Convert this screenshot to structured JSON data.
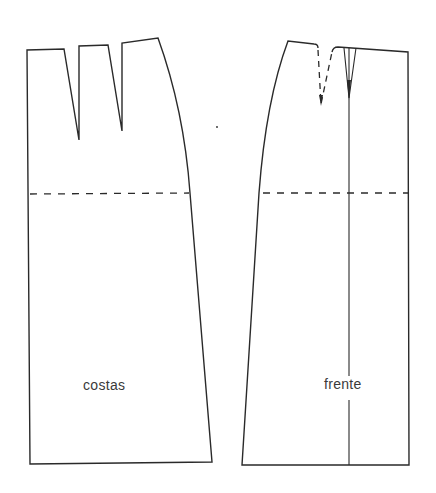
{
  "diagram": {
    "type": "sewing-pattern",
    "pieces": [
      {
        "id": "back",
        "label": "costas",
        "darts": 2,
        "hip_line": "dashed"
      },
      {
        "id": "front",
        "label": "frente",
        "darts": "1 dashed dart + 1 fold pleat at center line",
        "hip_line": "dashed",
        "center_line": true
      }
    ],
    "colors": {
      "line": "#2a2a2a",
      "background": "#ffffff",
      "text": "#3a3a3a"
    }
  }
}
